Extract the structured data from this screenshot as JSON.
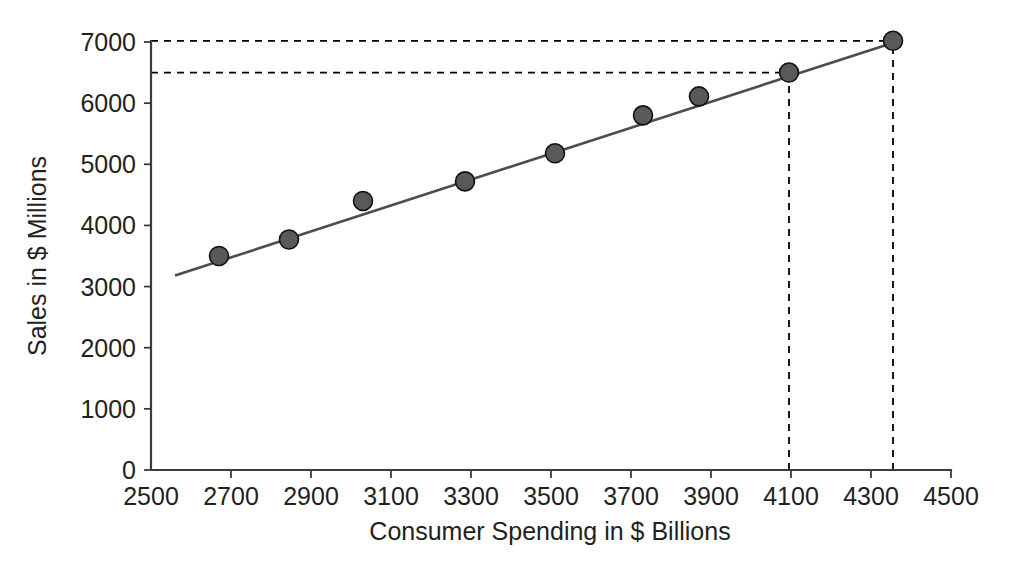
{
  "chart_data": {
    "type": "scatter",
    "title": "",
    "xlabel": "Consumer Spending in $ Billions",
    "ylabel": "Sales in $ Millions",
    "xlim": [
      2500,
      4500
    ],
    "ylim": [
      0,
      7000
    ],
    "xticks": [
      2500,
      2700,
      2900,
      3100,
      3300,
      3500,
      3700,
      3900,
      4100,
      4300,
      4500
    ],
    "yticks": [
      0,
      1000,
      2000,
      3000,
      4000,
      5000,
      6000,
      7000
    ],
    "xtick_labels": [
      "2500",
      "2700",
      "2900",
      "3100",
      "3300",
      "3500",
      "3700",
      "3900",
      "4100",
      "4300",
      "4500"
    ],
    "ytick_labels": [
      "0",
      "1000",
      "2000",
      "3000",
      "4000",
      "5000",
      "6000",
      "7000"
    ],
    "grid": false,
    "legend": null,
    "series": [
      {
        "name": "Observed sales",
        "type": "scatter",
        "marker": "filled-circle",
        "color": "#595959",
        "points": [
          {
            "x": 2670,
            "y": 3500
          },
          {
            "x": 2845,
            "y": 3770
          },
          {
            "x": 3030,
            "y": 4400
          },
          {
            "x": 3285,
            "y": 4720
          },
          {
            "x": 3510,
            "y": 5180
          },
          {
            "x": 3730,
            "y": 5800
          },
          {
            "x": 3870,
            "y": 6110
          },
          {
            "x": 4095,
            "y": 6500
          },
          {
            "x": 4355,
            "y": 7020
          }
        ]
      },
      {
        "name": "Least squares regression line",
        "type": "line",
        "color": "#4d4d4d",
        "endpoints": [
          {
            "x": 2560,
            "y": 3180
          },
          {
            "x": 4375,
            "y": 7030
          }
        ]
      }
    ],
    "annotations": [
      {
        "name": "prediction-guide-7000",
        "kind": "dashed-horizontal",
        "y": 7020,
        "x_from": 2500,
        "x_to": 4355
      },
      {
        "name": "prediction-guide-6500",
        "kind": "dashed-horizontal",
        "y": 6500,
        "x_from": 2500,
        "x_to": 4095
      },
      {
        "name": "prediction-guide-4100",
        "kind": "dashed-vertical",
        "x": 4095,
        "y_from": 0,
        "y_to": 6500
      },
      {
        "name": "prediction-guide-4355",
        "kind": "dashed-vertical",
        "x": 4355,
        "y_from": 0,
        "y_to": 7020
      }
    ]
  }
}
